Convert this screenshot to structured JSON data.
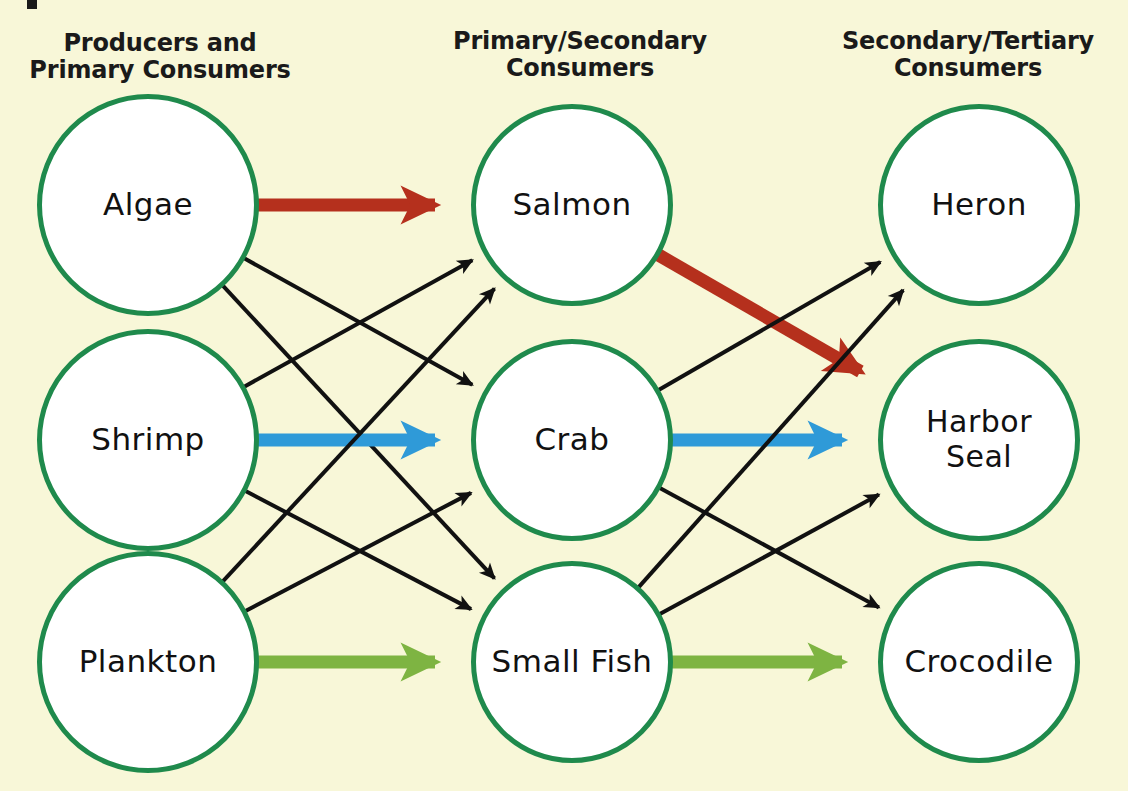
{
  "diagram": {
    "background_color": "#f8f7d8",
    "node_stroke_color": "#1f8a4c",
    "node_fill_color": "#ffffff",
    "columns": [
      {
        "id": "col-producers",
        "header": "Producers and\nPrimary Consumers"
      },
      {
        "id": "col-primary-secondary",
        "header": "Primary/Secondary\nConsumers"
      },
      {
        "id": "col-secondary-tertiary",
        "header": "Secondary/Tertiary\nConsumers"
      }
    ],
    "nodes": [
      {
        "id": "algae",
        "label": "Algae",
        "column": 0,
        "row": 0,
        "cx": 148,
        "cy": 205,
        "r": 111
      },
      {
        "id": "shrimp",
        "label": "Shrimp",
        "column": 0,
        "row": 1,
        "cx": 148,
        "cy": 440,
        "r": 111
      },
      {
        "id": "plankton",
        "label": "Plankton",
        "column": 0,
        "row": 2,
        "cx": 148,
        "cy": 662,
        "r": 111
      },
      {
        "id": "salmon",
        "label": "Salmon",
        "column": 1,
        "row": 0,
        "cx": 572,
        "cy": 205,
        "r": 101
      },
      {
        "id": "crab",
        "label": "Crab",
        "column": 1,
        "row": 1,
        "cx": 572,
        "cy": 440,
        "r": 101
      },
      {
        "id": "small-fish",
        "label": "Small Fish",
        "column": 1,
        "row": 2,
        "cx": 572,
        "cy": 662,
        "r": 101
      },
      {
        "id": "heron",
        "label": "Heron",
        "column": 2,
        "row": 0,
        "cx": 979,
        "cy": 205,
        "r": 101
      },
      {
        "id": "harbor-seal",
        "label": "Harbor\nSeal",
        "column": 2,
        "row": 1,
        "cx": 979,
        "cy": 440,
        "r": 101
      },
      {
        "id": "crocodile",
        "label": "Crocodile",
        "column": 2,
        "row": 2,
        "cx": 979,
        "cy": 662,
        "r": 101
      }
    ],
    "edge_colors": {
      "default": "#111111",
      "red": "#b5301d",
      "blue": "#2f9ad8",
      "green": "#7eb442"
    },
    "edges": [
      {
        "from": "algae",
        "to": "salmon",
        "color": "red",
        "width": 13,
        "name": "edge-algae-salmon"
      },
      {
        "from": "algae",
        "to": "crab",
        "color": "default",
        "width": 4,
        "name": "edge-algae-crab"
      },
      {
        "from": "algae",
        "to": "small-fish",
        "color": "default",
        "width": 4,
        "name": "edge-algae-small-fish"
      },
      {
        "from": "shrimp",
        "to": "salmon",
        "color": "default",
        "width": 4,
        "name": "edge-shrimp-salmon"
      },
      {
        "from": "shrimp",
        "to": "crab",
        "color": "blue",
        "width": 13,
        "name": "edge-shrimp-crab"
      },
      {
        "from": "shrimp",
        "to": "small-fish",
        "color": "default",
        "width": 4,
        "name": "edge-shrimp-small-fish"
      },
      {
        "from": "plankton",
        "to": "salmon",
        "color": "default",
        "width": 4,
        "name": "edge-plankton-salmon"
      },
      {
        "from": "plankton",
        "to": "crab",
        "color": "default",
        "width": 4,
        "name": "edge-plankton-crab"
      },
      {
        "from": "plankton",
        "to": "small-fish",
        "color": "green",
        "width": 13,
        "name": "edge-plankton-small-fish"
      },
      {
        "from": "salmon",
        "to": "harbor-seal",
        "color": "red",
        "width": 13,
        "name": "edge-salmon-harbor-seal"
      },
      {
        "from": "crab",
        "to": "heron",
        "color": "default",
        "width": 4,
        "name": "edge-crab-heron"
      },
      {
        "from": "crab",
        "to": "harbor-seal",
        "color": "blue",
        "width": 13,
        "name": "edge-crab-harbor-seal"
      },
      {
        "from": "crab",
        "to": "crocodile",
        "color": "default",
        "width": 4,
        "name": "edge-crab-crocodile"
      },
      {
        "from": "small-fish",
        "to": "heron",
        "color": "default",
        "width": 4,
        "name": "edge-small-fish-heron"
      },
      {
        "from": "small-fish",
        "to": "harbor-seal",
        "color": "default",
        "width": 4,
        "name": "edge-small-fish-harbor-seal"
      },
      {
        "from": "small-fish",
        "to": "crocodile",
        "color": "green",
        "width": 13,
        "name": "edge-small-fish-crocodile"
      }
    ]
  }
}
